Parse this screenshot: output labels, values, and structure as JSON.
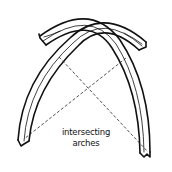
{
  "figure": {
    "caption_line1": "intersecting",
    "caption_line2": "arches",
    "colors": {
      "ink": "#111111",
      "background": "#ffffff"
    },
    "elements": [
      "left-arch",
      "right-arch",
      "left-arch-stub",
      "right-arch-stub",
      "dashed-construction-line-left",
      "dashed-construction-line-right"
    ]
  }
}
